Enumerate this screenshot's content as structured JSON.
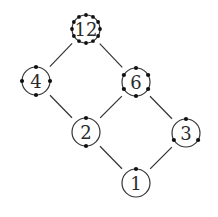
{
  "diagram": {
    "type": "hasse",
    "title": "",
    "colors": {
      "stroke": "#333333",
      "dot": "#111111",
      "background": "#ffffff"
    },
    "nodes": [
      {
        "id": "n12",
        "label": "12",
        "x": 86,
        "y": 29,
        "dots": 12
      },
      {
        "id": "n4",
        "label": "4",
        "x": 36,
        "y": 81,
        "dots": 4
      },
      {
        "id": "n6",
        "label": "6",
        "x": 136,
        "y": 82,
        "dots": 6
      },
      {
        "id": "n2",
        "label": "2",
        "x": 86,
        "y": 132,
        "dots": 2
      },
      {
        "id": "n3",
        "label": "3",
        "x": 186,
        "y": 133,
        "dots": 3
      },
      {
        "id": "n1",
        "label": "1",
        "x": 136,
        "y": 183,
        "dots": 1
      }
    ],
    "edges": [
      {
        "from": "n12",
        "to": "n4"
      },
      {
        "from": "n12",
        "to": "n6"
      },
      {
        "from": "n4",
        "to": "n2"
      },
      {
        "from": "n6",
        "to": "n2"
      },
      {
        "from": "n6",
        "to": "n3"
      },
      {
        "from": "n2",
        "to": "n1"
      },
      {
        "from": "n3",
        "to": "n1"
      }
    ],
    "node_radius": 14
  }
}
